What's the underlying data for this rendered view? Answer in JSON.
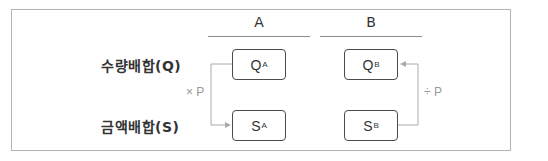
{
  "columns": [
    {
      "label": "A"
    },
    {
      "label": "B"
    }
  ],
  "rows": [
    {
      "label": "수량배합(Q)"
    },
    {
      "label": "금액배합(S)"
    }
  ],
  "boxes": {
    "qa": {
      "main": "Q",
      "sub": "A"
    },
    "sa": {
      "main": "S",
      "sub": "A"
    },
    "qb": {
      "main": "Q",
      "sub": "B"
    },
    "sb": {
      "main": "S",
      "sub": "B"
    }
  },
  "operations": {
    "multiply": {
      "label": "× P",
      "direction": "Q_A → S_A"
    },
    "divide": {
      "label": "÷ P",
      "direction": "S_B → Q_B"
    }
  },
  "colors": {
    "frame": "#b4b4b4",
    "box_border": "#4a4a4a",
    "arrow": "#aaaaaa",
    "text": "#333333",
    "op_text": "#999999"
  }
}
